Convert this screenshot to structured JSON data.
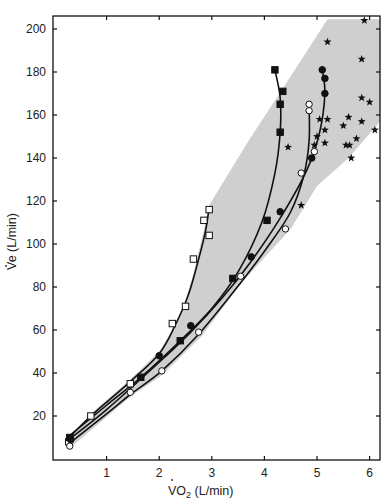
{
  "chart_data": {
    "type": "scatter",
    "title": "",
    "xlabel": "V̇O2 (L/min)",
    "ylabel": "V̇e (L/min)",
    "xlim": [
      0,
      6.2
    ],
    "ylim": [
      0,
      205
    ],
    "x_ticks": [
      1,
      2,
      3,
      4,
      5,
      6
    ],
    "y_ticks": [
      20,
      40,
      60,
      80,
      100,
      120,
      140,
      160,
      180,
      200
    ],
    "grid": false,
    "legend": null,
    "shaded_region": {
      "description": "grey envelope bounding all subjects' data",
      "color": "#cfcfcf"
    },
    "series": [
      {
        "name": "open-squares",
        "marker": "square-open",
        "with_fit_curve": true,
        "points": [
          [
            0.28,
            8
          ],
          [
            0.7,
            20
          ],
          [
            1.45,
            35
          ],
          [
            2.25,
            63
          ],
          [
            2.5,
            71
          ],
          [
            2.65,
            93
          ],
          [
            2.85,
            111
          ],
          [
            2.95,
            104
          ],
          [
            2.95,
            116
          ]
        ]
      },
      {
        "name": "filled-squares",
        "marker": "square-filled",
        "with_fit_curve": true,
        "points": [
          [
            0.3,
            10
          ],
          [
            1.65,
            38
          ],
          [
            2.4,
            55
          ],
          [
            3.4,
            84
          ],
          [
            4.05,
            111
          ],
          [
            4.3,
            152
          ],
          [
            4.3,
            165
          ],
          [
            4.35,
            171
          ],
          [
            4.2,
            181
          ]
        ]
      },
      {
        "name": "filled-circles",
        "marker": "circle-filled",
        "with_fit_curve": true,
        "points": [
          [
            0.32,
            9
          ],
          [
            2.0,
            48
          ],
          [
            2.6,
            62
          ],
          [
            3.75,
            94
          ],
          [
            4.3,
            115
          ],
          [
            4.9,
            140
          ],
          [
            5.15,
            170
          ],
          [
            5.15,
            177
          ],
          [
            5.1,
            181
          ]
        ]
      },
      {
        "name": "open-circles",
        "marker": "circle-open",
        "with_fit_curve": true,
        "points": [
          [
            0.3,
            6
          ],
          [
            1.45,
            31
          ],
          [
            2.05,
            41
          ],
          [
            2.75,
            59
          ],
          [
            3.55,
            85
          ],
          [
            4.4,
            107
          ],
          [
            4.7,
            133
          ],
          [
            4.95,
            143
          ],
          [
            4.85,
            162
          ],
          [
            4.85,
            165
          ]
        ]
      },
      {
        "name": "stars",
        "marker": "star",
        "with_fit_curve": false,
        "points": [
          [
            4.45,
            145
          ],
          [
            4.7,
            118
          ],
          [
            5.2,
            194
          ],
          [
            5.0,
            150
          ],
          [
            5.15,
            153
          ],
          [
            5.05,
            158
          ],
          [
            5.2,
            158
          ],
          [
            4.95,
            146
          ],
          [
            5.15,
            147
          ],
          [
            5.5,
            155
          ],
          [
            5.6,
            159
          ],
          [
            5.55,
            146
          ],
          [
            5.62,
            146
          ],
          [
            5.65,
            140
          ],
          [
            5.9,
            204
          ],
          [
            5.85,
            186
          ],
          [
            5.85,
            168
          ],
          [
            6.0,
            166
          ],
          [
            5.85,
            157
          ],
          [
            5.75,
            149
          ],
          [
            6.1,
            153
          ]
        ]
      }
    ]
  },
  "axes": {
    "x_title_main": "VO",
    "x_title_sub": "2",
    "x_title_rest": " (L/min)",
    "y_title": "Ve (L/min)",
    "x_tick_labels": [
      "1",
      "2",
      "3",
      "4",
      "5",
      "6"
    ],
    "y_tick_labels": [
      "20",
      "40",
      "60",
      "80",
      "100",
      "120",
      "140",
      "160",
      "180",
      "200"
    ]
  }
}
